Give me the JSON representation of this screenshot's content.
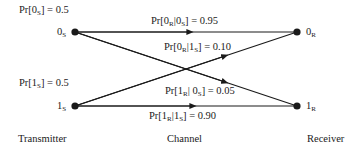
{
  "diagram": {
    "type": "binary-channel",
    "priors": [
      {
        "symbol": "0",
        "sub": "S",
        "text": "Pr[0S] = 0.5",
        "value": "0.5"
      },
      {
        "symbol": "1",
        "sub": "S",
        "text": "Pr[1S] = 0.5",
        "value": "0.5"
      }
    ],
    "nodes": {
      "tx0": {
        "main": "0",
        "sub": "S"
      },
      "tx1": {
        "main": "1",
        "sub": "S"
      },
      "rx0": {
        "main": "0",
        "sub": "R"
      },
      "rx1": {
        "main": "1",
        "sub": "R"
      }
    },
    "transitions": [
      {
        "from": "0S",
        "to": "0R",
        "a": "0",
        "as": "R",
        "b": "0",
        "bs": "S",
        "sep": "|",
        "value": "0.95"
      },
      {
        "from": "1S",
        "to": "0R",
        "a": "0",
        "as": "R",
        "b": "1",
        "bs": "S",
        "sep": "|",
        "value": "0.10"
      },
      {
        "from": "0S",
        "to": "1R",
        "a": "1",
        "as": "R",
        "b": "0",
        "bs": "S",
        "sep": "| ",
        "value": "0.05"
      },
      {
        "from": "1S",
        "to": "1R",
        "a": "1",
        "as": "R",
        "b": "1",
        "bs": "S",
        "sep": "|",
        "value": "0.90"
      }
    ],
    "footer": {
      "transmitter": "Transmitter",
      "channel": "Channel",
      "receiver": "Receiver"
    },
    "colors": {
      "line": "#1a1a1a",
      "text": "#1a1a1a",
      "background": "#ffffff"
    }
  }
}
